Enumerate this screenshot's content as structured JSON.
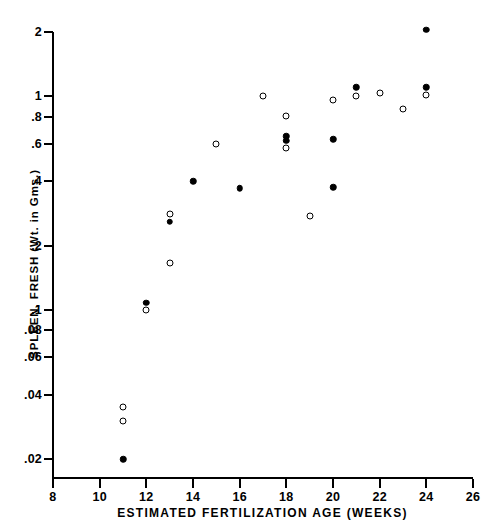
{
  "figure": {
    "type": "scatter-plot",
    "background": "#ffffff",
    "ink_color": "#000000",
    "width": 485,
    "height": 528
  },
  "axes": {
    "x": {
      "label": "ESTIMATED FERTILIZATION AGE (WEEKS)",
      "scale": "linear",
      "range": [
        8,
        26
      ],
      "ticks": [
        8,
        10,
        12,
        14,
        16,
        18,
        20,
        22,
        24,
        26
      ],
      "tick_labels": [
        "8",
        "10",
        "12",
        "14",
        "16",
        "18",
        "20",
        "22",
        "24",
        "26"
      ]
    },
    "y": {
      "label": "SPLEEN, FRESH (Wt. in Gms.)",
      "scale": "log",
      "range": [
        0.017,
        2.2
      ],
      "ticks": [
        0.02,
        0.04,
        0.06,
        0.08,
        0.1,
        0.2,
        0.4,
        0.6,
        0.8,
        1,
        2
      ],
      "tick_labels": [
        ".02",
        ".04",
        ".06",
        ".08",
        ".1",
        ".2",
        ".4",
        ".6",
        ".8",
        "1",
        "2"
      ]
    },
    "grid": "off",
    "legend": "none"
  },
  "chart_data": {
    "type": "scatter",
    "title": "",
    "xlabel": "ESTIMATED FERTILIZATION AGE (WEEKS)",
    "ylabel": "SPLEEN, FRESH (Wt. in Gms.)",
    "xlim": [
      8,
      26
    ],
    "ylim": [
      0.017,
      2.2
    ],
    "yscale": "log",
    "xscale": "linear",
    "series": [
      {
        "name": "open-circle",
        "marker": "open circle",
        "points": [
          {
            "x": 11,
            "y": 0.035
          },
          {
            "x": 11,
            "y": 0.03
          },
          {
            "x": 12,
            "y": 0.1
          },
          {
            "x": 13,
            "y": 0.165
          },
          {
            "x": 13,
            "y": 0.28
          },
          {
            "x": 15,
            "y": 0.6
          },
          {
            "x": 17,
            "y": 1.0
          },
          {
            "x": 18,
            "y": 0.81
          },
          {
            "x": 18,
            "y": 0.57
          },
          {
            "x": 19,
            "y": 0.275
          },
          {
            "x": 20,
            "y": 0.96
          },
          {
            "x": 21,
            "y": 1.0
          },
          {
            "x": 22,
            "y": 1.04
          },
          {
            "x": 23,
            "y": 0.87
          },
          {
            "x": 24,
            "y": 1.01
          }
        ]
      },
      {
        "name": "filled-circle",
        "marker": "filled circle",
        "points": [
          {
            "x": 11,
            "y": 0.02
          },
          {
            "x": 12,
            "y": 0.108
          },
          {
            "x": 13,
            "y": 0.258
          },
          {
            "x": 14,
            "y": 0.4
          },
          {
            "x": 16,
            "y": 0.37
          },
          {
            "x": 18,
            "y": 0.65
          },
          {
            "x": 18,
            "y": 0.62
          },
          {
            "x": 20,
            "y": 0.63
          },
          {
            "x": 20,
            "y": 0.375
          },
          {
            "x": 21,
            "y": 1.1
          },
          {
            "x": 24,
            "y": 2.05
          },
          {
            "x": 24,
            "y": 1.1
          }
        ]
      }
    ]
  }
}
